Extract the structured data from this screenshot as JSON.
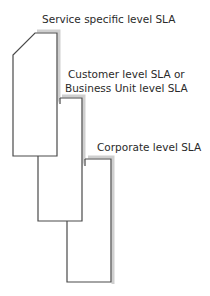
{
  "diagram": {
    "levels": [
      {
        "id": "service",
        "label": "Service specific level SLA"
      },
      {
        "id": "customer",
        "label_lines": [
          "Customer level SLA or",
          "Business Unit level SLA"
        ]
      },
      {
        "id": "corporate",
        "label": "Corporate level SLA"
      }
    ],
    "colors": {
      "stroke": "#4a4a4a",
      "shadow": "#c8c8c8",
      "text": "#2a2a2a"
    }
  }
}
